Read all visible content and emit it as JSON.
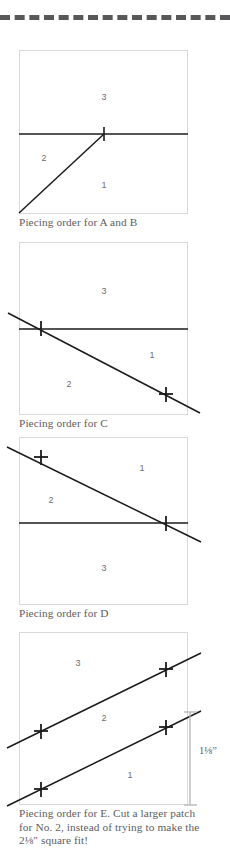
{
  "page": {
    "divider": {
      "name": "top-dashed-rule",
      "color": "#58585a"
    },
    "colors": {
      "line": "#1b1b1b",
      "box_border": "#d9d9d9",
      "caption_text": "#5d5d5f",
      "number_label": "#6e6e70",
      "dimension_line": "#b4b4b4"
    }
  },
  "figures": [
    {
      "id": "fig-a-b",
      "caption": "Piecing order for A and B",
      "piece_numbers": [
        "3",
        "2",
        "1"
      ],
      "numbers": [
        {
          "value": "3",
          "x": 104,
          "y": 97
        },
        {
          "value": "2",
          "x": 44,
          "y": 158
        },
        {
          "value": "1",
          "x": 104,
          "y": 185
        }
      ],
      "tick_count": 1
    },
    {
      "id": "fig-c",
      "caption": "Piecing order for C",
      "piece_numbers": [
        "3",
        "1",
        "2"
      ],
      "numbers": [
        {
          "value": "3",
          "x": 104,
          "y": 291
        },
        {
          "value": "1",
          "x": 152,
          "y": 355
        },
        {
          "value": "2",
          "x": 69,
          "y": 384
        }
      ],
      "tick_count": 2
    },
    {
      "id": "fig-d",
      "caption": "Piecing order for D",
      "piece_numbers": [
        "1",
        "2",
        "3"
      ],
      "numbers": [
        {
          "value": "1",
          "x": 142,
          "y": 468
        },
        {
          "value": "2",
          "x": 51,
          "y": 500
        },
        {
          "value": "3",
          "x": 104,
          "y": 568
        }
      ],
      "tick_count": 2
    },
    {
      "id": "fig-e",
      "caption": "Piecing order for E. Cut a larger patch for No. 2, instead of trying to make the 2⅛\" square fit!",
      "piece_numbers": [
        "3",
        "2",
        "1"
      ],
      "numbers": [
        {
          "value": "3",
          "x": 78,
          "y": 663
        },
        {
          "value": "2",
          "x": 104,
          "y": 718
        },
        {
          "value": "1",
          "x": 130,
          "y": 775
        }
      ],
      "tick_count": 4,
      "dimension": {
        "whole": "1",
        "numerator": "1",
        "denominator": "8",
        "unit": "”",
        "text": "1⅛”"
      }
    }
  ]
}
